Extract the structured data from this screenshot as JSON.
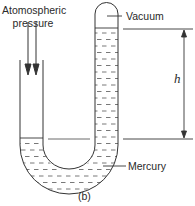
{
  "diagram": {
    "type": "u-tube-barometer",
    "labels": {
      "atmospheric_line1": "Atomospheric",
      "atmospheric_line2": "pressure",
      "vacuum": "Vacuum",
      "height": "h",
      "mercury": "Mercury",
      "caption": "(b)"
    },
    "colors": {
      "stroke": "#333333",
      "background": "#ffffff"
    }
  }
}
